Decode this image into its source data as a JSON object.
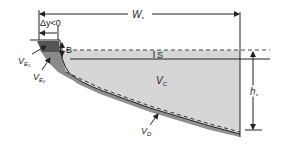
{
  "diagram": {
    "type": "cross-section schematic",
    "labels": {
      "width": "W",
      "width_sub": "*",
      "delta_y": "Δy<0",
      "B": "B",
      "S": "S",
      "VE1": "V",
      "VE1_sub": "E",
      "VE1_subsub": "1",
      "VE2": "V",
      "VE2_sub": "E",
      "VE2_subsub": "2",
      "VC": "V",
      "VC_sub": "C",
      "VD": "V",
      "VD_sub": "D",
      "h": "h",
      "h_sub": "*"
    },
    "regions": [
      {
        "name": "V_E1",
        "fill": "#555555"
      },
      {
        "name": "V_E2",
        "fill": "#8a8a8a"
      },
      {
        "name": "V_C",
        "fill": "#d6d6d6"
      },
      {
        "name": "V_D",
        "fill": "#999999"
      }
    ],
    "colors": {
      "line": "#222222",
      "dashed": "#444444",
      "background": "#ffffff"
    }
  }
}
